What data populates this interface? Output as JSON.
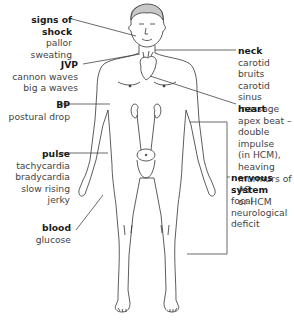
{
  "labels": {
    "shock": {
      "title": "signs of shock",
      "lines": [
        "pallor",
        "sweating"
      ]
    },
    "jvp": {
      "title": "JVP",
      "lines": [
        "cannon waves",
        "big a waves"
      ]
    },
    "bp": {
      "title": "BP",
      "lines": [
        "postural drop"
      ]
    },
    "pulse": {
      "title": "pulse",
      "lines": [
        "tachycardia",
        "bradycardia",
        "slow rising",
        "jerky"
      ]
    },
    "blood": {
      "title": "blood",
      "lines": [
        "glucose"
      ]
    },
    "neck": {
      "title": "neck",
      "lines": [
        "carotid bruits",
        "carotid sinus",
        "massage"
      ]
    },
    "heart": {
      "title": "heart",
      "lines": [
        "apex beat –",
        "double impulse",
        "(in HCM),",
        "heaving",
        "murmurs of AS",
        "or HCM"
      ]
    },
    "nervous": {
      "title": "nervous system",
      "lines": [
        "focal neurological",
        "deficit"
      ]
    }
  },
  "colors": {
    "line": "#444444",
    "figure": "#333333",
    "text_bold": "#1a1a1a",
    "text": "#444444"
  }
}
